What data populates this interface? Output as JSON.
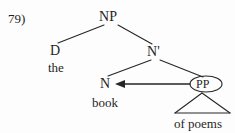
{
  "figure": {
    "item_number": "79)",
    "type": "syntax-tree"
  },
  "tree": {
    "nodes": [
      {
        "id": "np",
        "label": "NP",
        "x": 110,
        "y": 17,
        "kind": "phrase"
      },
      {
        "id": "d",
        "label": "D",
        "x": 55,
        "y": 51,
        "kind": "head"
      },
      {
        "id": "nbar",
        "label": "N'",
        "x": 155,
        "y": 52,
        "kind": "bar"
      },
      {
        "id": "n",
        "label": "N",
        "x": 106,
        "y": 84,
        "kind": "head"
      },
      {
        "id": "pp",
        "label": "PP",
        "x": 206,
        "y": 84,
        "kind": "phrase",
        "circled": true
      }
    ],
    "terminals": [
      {
        "id": "the",
        "label": "the",
        "parent": "d",
        "x": 55,
        "y": 67
      },
      {
        "id": "book",
        "label": "book",
        "parent": "n",
        "x": 106,
        "y": 102
      },
      {
        "id": "of_poems",
        "label": "of poems",
        "parent": "pp",
        "x": 202,
        "y": 123,
        "triangle": true
      }
    ],
    "edges": [
      {
        "from": "np",
        "to": "d",
        "type": "branch"
      },
      {
        "from": "np",
        "to": "nbar",
        "type": "branch"
      },
      {
        "from": "nbar",
        "to": "n",
        "type": "branch"
      },
      {
        "from": "nbar",
        "to": "pp",
        "type": "branch"
      }
    ],
    "annotations": [
      {
        "id": "movement-arrow",
        "type": "arrow",
        "from": "pp",
        "to": "n",
        "direction": "leftward",
        "x1": 190,
        "y1": 84,
        "x2": 117,
        "y2": 84
      },
      {
        "id": "pp-ellipse",
        "type": "ellipse",
        "target": "pp",
        "cx": 206,
        "cy": 84,
        "rx": 16,
        "ry": 8
      },
      {
        "id": "pp-triangle",
        "type": "triangle",
        "target": "of_poems",
        "apex_x": 202,
        "apex_y": 93,
        "left_x": 175,
        "left_y": 113,
        "right_x": 230,
        "right_y": 113
      }
    ]
  },
  "colors": {
    "background": "#fdfdfd",
    "ink": "#1f1f1f",
    "line": "#262626"
  }
}
